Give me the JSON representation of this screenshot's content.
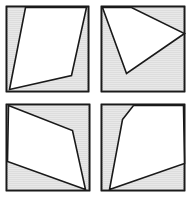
{
  "figure": {
    "width": 191,
    "height": 198,
    "background_color": "#ffffff",
    "panel_count": 4,
    "layout": "2x2 grid"
  },
  "style": {
    "square_fill": "#e8e8e8",
    "square_stroke": "#1a1a1a",
    "square_stroke_width": 1.6,
    "polygon_fill": "#ffffff",
    "polygon_stroke": "#1a1a1a",
    "polygon_stroke_width": 1.6,
    "hatch_color": "#d2d2d2",
    "hatch_spacing": 2
  },
  "panels": [
    {
      "id": "panel-top-left",
      "position": "top-left",
      "origin": [
        0,
        0
      ],
      "square": {
        "x": 6.5,
        "y": 6.5,
        "width": 82,
        "height": 85
      },
      "polygon": {
        "name": "inscribed-quadrilateral",
        "vertex_count": 4,
        "points": "25.5,7.5 86.5,7.5 71.5,75.5 9.5,89.5"
      }
    },
    {
      "id": "panel-top-right",
      "position": "top-right",
      "origin": [
        96,
        0
      ],
      "square": {
        "x": 5.5,
        "y": 6.5,
        "width": 83,
        "height": 85
      },
      "polygon": {
        "name": "inscribed-quadrilateral",
        "vertex_count": 4,
        "points": "6.5,7.5 35.5,7.5 88.5,33.5 30.5,73.5"
      }
    },
    {
      "id": "panel-bottom-left",
      "position": "bottom-left",
      "origin": [
        0,
        99
      ],
      "square": {
        "x": 6.5,
        "y": 5.5,
        "width": 83,
        "height": 86
      },
      "polygon": {
        "name": "inscribed-quadrilateral",
        "vertex_count": 4,
        "points": "8.5,6.5 72.5,31.5 85.5,90.5 7.5,62.5"
      }
    },
    {
      "id": "panel-bottom-right",
      "position": "bottom-right",
      "origin": [
        96,
        99
      ],
      "square": {
        "x": 5.5,
        "y": 5.5,
        "width": 83,
        "height": 86
      },
      "polygon": {
        "name": "inscribed-quadrilateral",
        "vertex_count": 4,
        "points": "26.5,20.5 37.5,6.5 87.5,6.5 88.5,64.5 13.5,90.5"
      }
    }
  ]
}
